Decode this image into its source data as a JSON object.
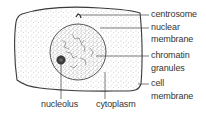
{
  "figure": {
    "type": "labeled-diagram",
    "colors": {
      "outline": "#3a3a3a",
      "stipple": "#9a9a9a",
      "text": "#333333",
      "background": "#ffffff"
    }
  },
  "labels": {
    "right": [
      {
        "id": "centrosome",
        "lines": [
          "centrosome"
        ]
      },
      {
        "id": "nuclear-membrane",
        "lines": [
          "nuclear",
          "membrane"
        ]
      },
      {
        "id": "chromatin-granules",
        "lines": [
          "chromatin",
          "granules"
        ]
      },
      {
        "id": "cell-membrane",
        "lines": [
          "cell",
          "membrane"
        ]
      }
    ],
    "bottom": [
      {
        "id": "nucleolus",
        "lines": [
          "nucleolus"
        ]
      },
      {
        "id": "cytoplasm",
        "lines": [
          "cytoplasm"
        ]
      }
    ]
  }
}
